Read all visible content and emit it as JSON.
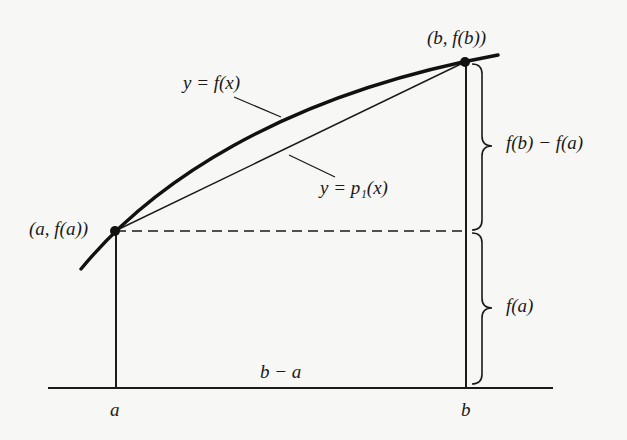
{
  "diagram": {
    "type": "linear interpolation / trapezoid approximation",
    "colors": {
      "ink": "#1a1a1a",
      "background": "#f7f7f5"
    },
    "labels": {
      "curve": "y = f(x)",
      "secant": "y = p₁(x)",
      "point_a": "(a, f(a))",
      "point_b": "(b, f(b))",
      "brace_upper": "f(b) − f(a)",
      "brace_lower": "f(a)",
      "width": "b − a",
      "tick_a": "a",
      "tick_b": "b"
    },
    "points": {
      "a": {
        "x": 115,
        "y": 231
      },
      "b": {
        "x": 465,
        "y": 62
      }
    },
    "baseline_y": 388
  }
}
